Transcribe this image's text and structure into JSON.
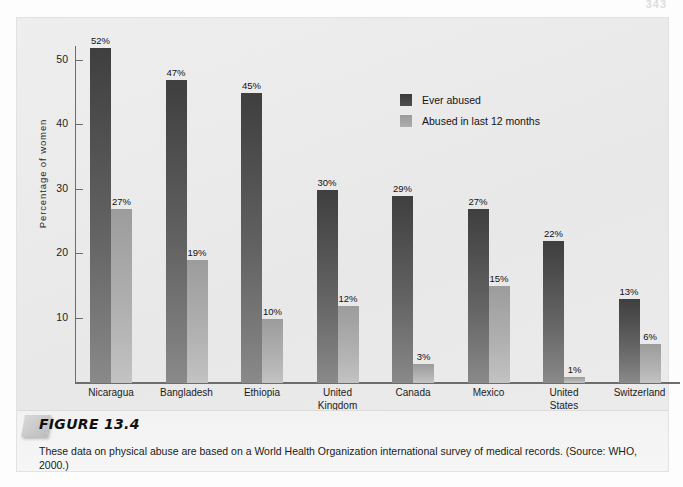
{
  "page": {
    "page_number": "343"
  },
  "figure": {
    "label": "FIGURE 13.4",
    "caption": "These data on physical abuse are based on a World Health Organization international survey of medical records. (Source: WHO, 2000.)"
  },
  "legend": {
    "items": [
      {
        "label": "Ever abused",
        "color": "#454545",
        "key": "ever_abused"
      },
      {
        "label": "Abused in last 12 months",
        "color": "#a3a3a3",
        "key": "last_12_months"
      }
    ]
  },
  "axes": {
    "y_title": "Percentage of women",
    "y_ticks": [
      "10",
      "20",
      "30",
      "40",
      "50"
    ],
    "y_tick_values": [
      10,
      20,
      30,
      40,
      50
    ]
  },
  "chart_data": {
    "type": "bar",
    "title": "",
    "xlabel": "",
    "ylabel": "Percentage of women",
    "ylim": [
      0,
      56
    ],
    "grid": false,
    "legend_position": "top-right",
    "categories": [
      "Nicaragua",
      "Bangladesh",
      "Ethiopia",
      "United Kingdom",
      "Canada",
      "Mexico",
      "United States",
      "Switzerland"
    ],
    "series": [
      {
        "name": "Ever abused",
        "color": "#454545",
        "values": [
          52,
          47,
          45,
          30,
          29,
          27,
          22,
          13
        ],
        "labels": [
          "52%",
          "47%",
          "45%",
          "30%",
          "29%",
          "27%",
          "22%",
          "13%"
        ]
      },
      {
        "name": "Abused in last 12 months",
        "color": "#a3a3a3",
        "values": [
          27,
          19,
          10,
          12,
          3,
          15,
          1,
          6
        ],
        "labels": [
          "27%",
          "19%",
          "10%",
          "12%",
          "3%",
          "15%",
          "1%",
          "6%"
        ]
      }
    ],
    "category_labels_wrapped": [
      [
        "Nicaragua"
      ],
      [
        "Bangladesh"
      ],
      [
        "Ethiopia"
      ],
      [
        "United",
        "Kingdom"
      ],
      [
        "Canada"
      ],
      [
        "Mexico"
      ],
      [
        "United",
        "States"
      ],
      [
        "Switzerland"
      ]
    ]
  }
}
